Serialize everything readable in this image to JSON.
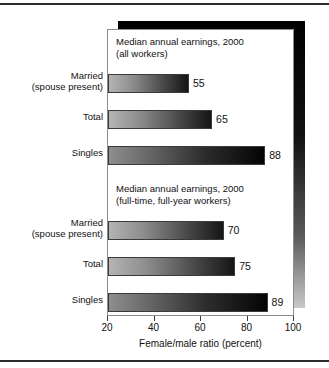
{
  "chart_data": {
    "type": "bar",
    "orientation": "horizontal",
    "title": "",
    "xlabel": "Female/male ratio (percent)",
    "ylabel": "",
    "xlim": [
      20,
      100
    ],
    "xticks": [
      20,
      40,
      60,
      80,
      100
    ],
    "grid": false,
    "legend": null,
    "groups": [
      {
        "label": "Median annual earnings, 2000\n(all workers)",
        "categories": [
          "Married\n(spouse present)",
          "Total",
          "Singles"
        ],
        "values": [
          55,
          65,
          88
        ]
      },
      {
        "label": "Median annual earnings, 2000\n(full-time, full-year workers)",
        "categories": [
          "Married\n(spouse present)",
          "Total",
          "Singles"
        ],
        "values": [
          70,
          75,
          89
        ]
      }
    ],
    "value_labels": [
      "55",
      "65",
      "88",
      "70",
      "75",
      "89"
    ],
    "colors": {
      "bar_gradient_start": "#b4b4b4",
      "bar_gradient_end": "#151515",
      "bar_outline": "#3a3a3a",
      "panel_background": "#ffffff",
      "panel_border": "#8d8d8d",
      "shadow": "#000000",
      "text": "#111111",
      "rule": "#2b2b2b"
    }
  },
  "axis": {
    "tick_labels": [
      "20",
      "40",
      "60",
      "80",
      "100"
    ],
    "title": "Female/male ratio (percent)"
  },
  "sections": {
    "first": {
      "title_line1": "Median annual earnings, 2000",
      "title_line2": "(all workers)",
      "title": "Median annual earnings, 2000\n(all workers)"
    },
    "second": {
      "title_line1": "Median annual earnings, 2000",
      "title_line2": "(full-time, full-year workers)",
      "title": "Median annual earnings, 2000\n(full-time, full-year workers)"
    }
  },
  "categories": {
    "married": "Married\n(spouse present)",
    "total": "Total",
    "singles": "Singles"
  },
  "bars": [
    {
      "name": "all-married",
      "value": 55,
      "label": "55"
    },
    {
      "name": "all-total",
      "value": 65,
      "label": "65"
    },
    {
      "name": "all-singles",
      "value": 88,
      "label": "88"
    },
    {
      "name": "ft-married",
      "value": 70,
      "label": "70"
    },
    {
      "name": "ft-total",
      "value": 75,
      "label": "75"
    },
    {
      "name": "ft-singles",
      "value": 89,
      "label": "89"
    }
  ]
}
